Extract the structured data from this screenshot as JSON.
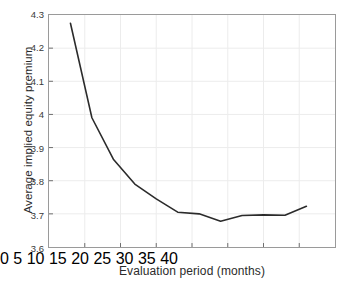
{
  "chart_data": {
    "type": "line",
    "title": "",
    "subtitle": "",
    "xlabel": "Evaluation period (months)",
    "ylabel": "Average implied equity premium",
    "xlim": [
      0,
      40
    ],
    "ylim": [
      3.6,
      4.3
    ],
    "xticks": [
      0,
      5,
      10,
      15,
      20,
      25,
      30,
      35,
      40
    ],
    "xtick_labels": [
      "0",
      "5",
      "10",
      "15",
      "20",
      "25",
      "30",
      "35",
      "40"
    ],
    "yticks": [
      3.6,
      3.7,
      3.8,
      3.9,
      4.0,
      4.1,
      4.2,
      4.3
    ],
    "ytick_labels": [
      "3.6",
      "3.7",
      "3.8",
      "3.9",
      "4",
      "4.1",
      "4.2",
      "4.3"
    ],
    "grid": true,
    "grid_color": "#e8e8e8",
    "legend": null,
    "legend_position": "none",
    "series": [
      {
        "name": "Average implied equity premium",
        "color": "#2b2b2b",
        "line_width": 1.6,
        "x": [
          3,
          6,
          9,
          12,
          15,
          18,
          21,
          24,
          27,
          30,
          33,
          36
        ],
        "y": [
          4.275,
          3.99,
          3.865,
          3.79,
          3.745,
          3.705,
          3.7,
          3.678,
          3.695,
          3.697,
          3.696,
          3.723
        ]
      }
    ],
    "annotations": []
  },
  "axes": {
    "border_color": "#9a9a9a",
    "background": "#ffffff"
  }
}
